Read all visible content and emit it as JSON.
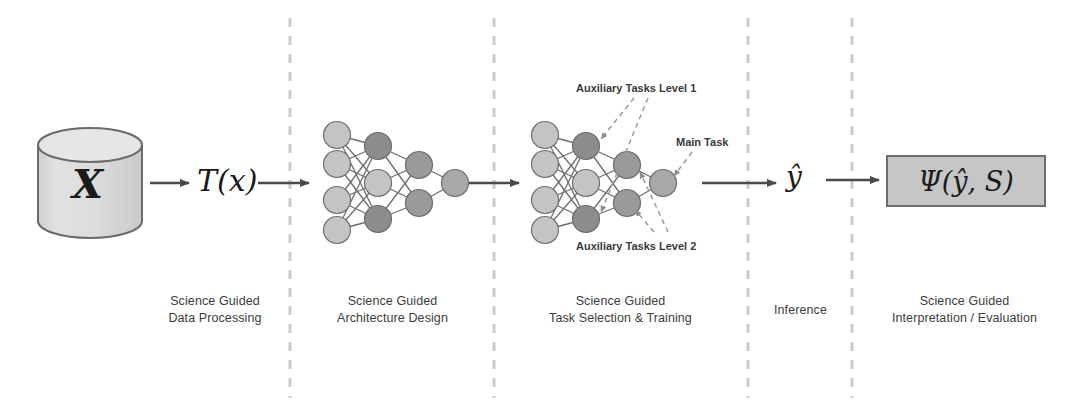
{
  "figure": {
    "background": "#ffffff"
  },
  "stages": [
    {
      "id": "data-processing",
      "caption_line1": "Science Guided",
      "caption_line2": "Data Processing",
      "caption_center_x": 215,
      "caption_top_y": 293
    },
    {
      "id": "architecture-design",
      "caption_line1": "Science Guided",
      "caption_line2": "Architecture Design",
      "caption_center_x": 392,
      "caption_top_y": 293
    },
    {
      "id": "task-selection-training",
      "caption_line1": "Science Guided",
      "caption_line2": "Task Selection & Training",
      "caption_center_x": 620,
      "caption_top_y": 293
    },
    {
      "id": "inference",
      "caption_line1": "Inference",
      "caption_line2": "",
      "caption_center_x": 800,
      "caption_top_y": 302
    },
    {
      "id": "interpretation-evaluation",
      "caption_line1": "Science Guided",
      "caption_line2": "Interpretation / Evaluation",
      "caption_center_x": 965,
      "caption_top_y": 293
    }
  ],
  "dividers": [
    {
      "name": "divider-1",
      "x": 290
    },
    {
      "name": "divider-2",
      "x": 494
    },
    {
      "name": "divider-3",
      "x": 748
    },
    {
      "name": "divider-4",
      "x": 852
    }
  ],
  "database": {
    "label": "X",
    "fill": "#d9d9d9",
    "stroke": "#6b6b6b",
    "center_x": 90,
    "center_y": 183
  },
  "transform": {
    "label": "T(x)",
    "x": 198,
    "y": 163
  },
  "prediction": {
    "label": "ŷ",
    "x": 786,
    "y": 160
  },
  "evaluation": {
    "label": "Ψ(ŷ, S)",
    "box_fill": "#c6c6c6",
    "box_stroke": "#6e6e6e",
    "x": 886,
    "y": 155,
    "width": 160,
    "height": 52
  },
  "annotations": [
    {
      "name": "auxiliary-tasks-level-1",
      "text": "Auxiliary Tasks Level 1",
      "x": 576,
      "y": 82
    },
    {
      "name": "main-task",
      "text": "Main Task",
      "x": 675,
      "y": 136
    },
    {
      "name": "auxiliary-tasks-level-2",
      "text": "Auxiliary Tasks Level 2",
      "x": 576,
      "y": 240
    }
  ],
  "arrows": [
    {
      "name": "arrow-data-to-transform",
      "x1": 143,
      "y1": 183,
      "x2": 190,
      "y2": 183
    },
    {
      "name": "arrow-transform-to-net1",
      "x1": 257,
      "y1": 183,
      "x2": 310,
      "y2": 183
    },
    {
      "name": "arrow-net1-to-net2",
      "x1": 463,
      "y1": 183,
      "x2": 518,
      "y2": 183
    },
    {
      "name": "arrow-net2-to-prediction",
      "x1": 703,
      "y1": 183,
      "x2": 775,
      "y2": 183
    },
    {
      "name": "arrow-prediction-to-evaluation",
      "x1": 824,
      "y1": 180,
      "x2": 878,
      "y2": 180
    }
  ],
  "networks": [
    {
      "name": "network-architecture",
      "origin_x": 310,
      "node_radius": 13.5,
      "layers": [
        {
          "name": "input-layer",
          "x": 337,
          "nodes": [
            {
              "y": 135,
              "fill": "#c4c4c4"
            },
            {
              "y": 164,
              "fill": "#c4c4c4"
            },
            {
              "y": 200,
              "fill": "#c4c4c4"
            },
            {
              "y": 230,
              "fill": "#c4c4c4"
            }
          ]
        },
        {
          "name": "hidden-layer-1",
          "x": 378,
          "nodes": [
            {
              "y": 146,
              "fill": "#8c8c8c"
            },
            {
              "y": 183,
              "fill": "#c4c4c4"
            },
            {
              "y": 219,
              "fill": "#8c8c8c"
            }
          ]
        },
        {
          "name": "hidden-layer-2",
          "x": 419,
          "nodes": [
            {
              "y": 165,
              "fill": "#9a9a9a"
            },
            {
              "y": 203,
              "fill": "#9a9a9a"
            }
          ]
        },
        {
          "name": "output-layer",
          "x": 455,
          "nodes": [
            {
              "y": 183,
              "fill": "#a8a8a8"
            }
          ]
        }
      ]
    },
    {
      "name": "network-task-selection",
      "origin_x": 518,
      "node_radius": 13.5,
      "layers": [
        {
          "name": "input-layer",
          "x": 545,
          "nodes": [
            {
              "y": 135,
              "fill": "#c4c4c4"
            },
            {
              "y": 164,
              "fill": "#c4c4c4"
            },
            {
              "y": 200,
              "fill": "#c4c4c4"
            },
            {
              "y": 230,
              "fill": "#c4c4c4"
            }
          ]
        },
        {
          "name": "hidden-layer-1",
          "x": 586,
          "nodes": [
            {
              "y": 146,
              "fill": "#8c8c8c"
            },
            {
              "y": 183,
              "fill": "#c4c4c4"
            },
            {
              "y": 219,
              "fill": "#8c8c8c"
            }
          ]
        },
        {
          "name": "hidden-layer-2",
          "x": 627,
          "nodes": [
            {
              "y": 165,
              "fill": "#9a9a9a"
            },
            {
              "y": 203,
              "fill": "#9a9a9a"
            }
          ]
        },
        {
          "name": "output-layer",
          "x": 663,
          "nodes": [
            {
              "y": 183,
              "fill": "#a8a8a8"
            }
          ]
        }
      ]
    }
  ],
  "colors": {
    "divider": "#cccccc",
    "arrow": "#4a4a4a",
    "edge": "#6e6e6e",
    "annotation_leader": "#9a9a9a",
    "text": "#3c3c3c"
  }
}
